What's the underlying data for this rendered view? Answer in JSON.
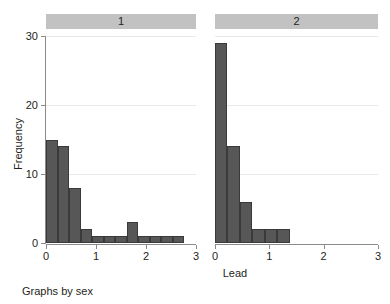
{
  "chart_data": {
    "type": "bar",
    "title": "",
    "subtitle": "",
    "xlabel": "Lead",
    "ylabel": "Frequency",
    "note": "Graphs by sex",
    "grid": true,
    "legend": "none",
    "facet_by": "sex",
    "xlim": [
      0,
      3
    ],
    "ylim": [
      0,
      30
    ],
    "xticks": [
      0,
      1,
      2,
      3
    ],
    "xtick_labels": [
      "0",
      "1",
      "2",
      "3"
    ],
    "yticks": [
      0,
      10,
      20,
      30
    ],
    "ytick_labels": [
      "0",
      "10",
      "20",
      "30"
    ],
    "bin_width": 0.23,
    "bar_color": "#575757",
    "bar_edge_color": "#3a3a3a",
    "strip_color": "#c2c2c2",
    "grid_color": "#e9e9e9",
    "axis_color": "#8a8a8a",
    "panels": [
      {
        "label": "1",
        "bins": [
          {
            "x0": 0.0,
            "x1": 0.23,
            "value": 15
          },
          {
            "x0": 0.23,
            "x1": 0.46,
            "value": 14
          },
          {
            "x0": 0.46,
            "x1": 0.69,
            "value": 8
          },
          {
            "x0": 0.69,
            "x1": 0.92,
            "value": 2
          },
          {
            "x0": 0.92,
            "x1": 1.15,
            "value": 1
          },
          {
            "x0": 1.15,
            "x1": 1.38,
            "value": 1
          },
          {
            "x0": 1.38,
            "x1": 1.61,
            "value": 1
          },
          {
            "x0": 1.61,
            "x1": 1.84,
            "value": 3
          },
          {
            "x0": 1.84,
            "x1": 2.07,
            "value": 1
          },
          {
            "x0": 2.07,
            "x1": 2.3,
            "value": 1
          },
          {
            "x0": 2.3,
            "x1": 2.53,
            "value": 1
          },
          {
            "x0": 2.53,
            "x1": 2.76,
            "value": 1
          }
        ]
      },
      {
        "label": "2",
        "bins": [
          {
            "x0": 0.0,
            "x1": 0.23,
            "value": 29
          },
          {
            "x0": 0.23,
            "x1": 0.46,
            "value": 14
          },
          {
            "x0": 0.46,
            "x1": 0.69,
            "value": 6
          },
          {
            "x0": 0.69,
            "x1": 0.92,
            "value": 2
          },
          {
            "x0": 0.92,
            "x1": 1.15,
            "value": 2
          },
          {
            "x0": 1.15,
            "x1": 1.38,
            "value": 2
          }
        ]
      }
    ]
  }
}
